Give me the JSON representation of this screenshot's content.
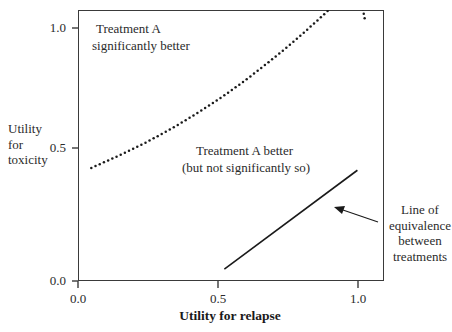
{
  "chart_data": {
    "type": "line",
    "title": "",
    "xlabel": "Utility for relapse",
    "ylabel": "Utility for toxicity",
    "xlim": [
      -0.05,
      1.1
    ],
    "ylim": [
      -0.05,
      1.1
    ],
    "xticks": [
      0.0,
      0.5,
      1.0
    ],
    "xticklabels": [
      "0.0",
      "0.5",
      "1.0"
    ],
    "yticks": [
      0.0,
      0.5,
      1.0
    ],
    "yticklabels": [
      "0.0",
      "0.5",
      "1.0"
    ],
    "grid": false,
    "legend": "none",
    "series": [
      {
        "name": "significance boundary",
        "style": "dotted",
        "color": "#1a1a1a",
        "x": [
          0.0,
          0.05,
          0.1,
          0.15,
          0.2,
          0.25,
          0.3,
          0.35,
          0.4,
          0.45,
          0.5,
          0.55,
          0.6,
          0.65,
          0.7,
          0.75,
          0.8,
          0.85,
          0.9,
          0.95,
          1.0,
          1.03
        ],
        "y": [
          0.43,
          0.455,
          0.48,
          0.507,
          0.535,
          0.565,
          0.596,
          0.629,
          0.664,
          0.7,
          0.738,
          0.778,
          0.82,
          0.864,
          0.909,
          0.956,
          1.005,
          1.056,
          1.108,
          1.162,
          1.218,
          1.05
        ]
      },
      {
        "name": "Line of equivalence between treatments",
        "style": "solid",
        "color": "#1a1a1a",
        "x": [
          0.5,
          1.0
        ],
        "y": [
          0.0,
          0.42
        ]
      }
    ],
    "annotations": [
      {
        "name": "treatment-a-significantly-better",
        "lines": [
          "Treatment A",
          "significantly better"
        ],
        "x": 0.12,
        "y": 0.95
      },
      {
        "name": "treatment-a-better",
        "lines": [
          "Treatment A better",
          "(but not significantly so)"
        ],
        "x": 0.45,
        "y": 0.52
      },
      {
        "name": "line-of-equivalence",
        "lines": [
          "Line of",
          "equivalence",
          "between",
          "treatments"
        ],
        "x": 1.12,
        "y": 0.3,
        "arrow_from": [
          1.08,
          0.225
        ],
        "arrow_to": [
          0.855,
          0.275
        ]
      }
    ]
  },
  "axes": {
    "y_title_lines": [
      "Utility",
      "for",
      "toxicity"
    ],
    "x_title": "Utility for relapse",
    "y_tick_0": "0.0",
    "y_tick_1": "0.5",
    "y_tick_2": "1.0",
    "x_tick_0": "0.0",
    "x_tick_1": "0.5",
    "x_tick_2": "1.0"
  },
  "annotations": {
    "upper_line1": "Treatment A",
    "upper_line2": "significantly better",
    "middle_line1": "Treatment A better",
    "middle_line2": "(but not significantly so)",
    "right_line1": "Line of",
    "right_line2": "equivalence",
    "right_line3": "between",
    "right_line4": "treatments"
  },
  "colors": {
    "axis": "#3a3a3a",
    "ink": "#1a1a1a",
    "background": "#ffffff"
  }
}
